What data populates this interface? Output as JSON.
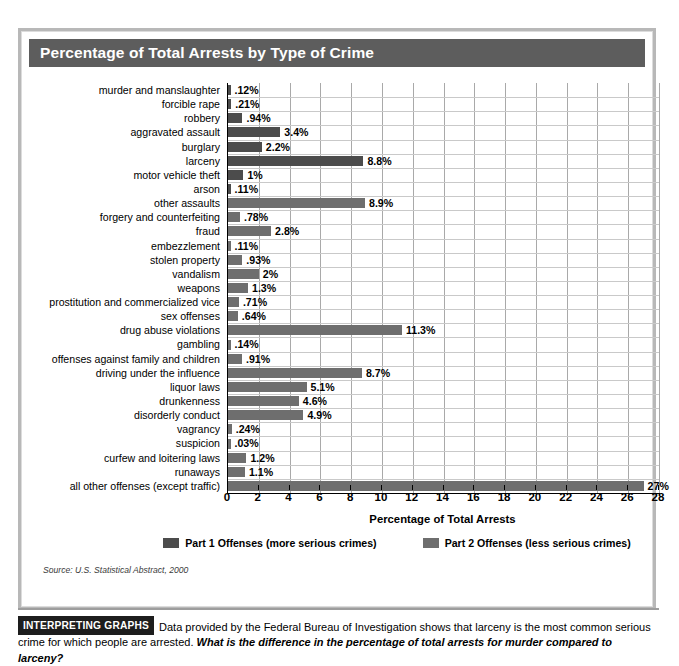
{
  "figure": {
    "title": "Percentage of Total Arrests by Type of Crime",
    "source": "Source: U.S. Statistical Abstract, 2000"
  },
  "chart_data": {
    "type": "bar",
    "orientation": "horizontal",
    "title": "Percentage of Total Arrests by Type of Crime",
    "xlabel": "Percentage of Total Arrests",
    "ylabel": "",
    "xlim": [
      0,
      28
    ],
    "xticks": [
      0,
      2,
      4,
      6,
      8,
      10,
      12,
      14,
      16,
      18,
      20,
      22,
      24,
      26,
      28
    ],
    "grid": "vertical",
    "legend_position": "bottom-center",
    "legend": [
      {
        "name": "Part 1 Offenses (more serious crimes)",
        "color": "#4c4c4c",
        "key": "p1"
      },
      {
        "name": "Part 2 Offenses (less serious crimes)",
        "color": "#6e6e6e",
        "key": "p2"
      }
    ],
    "categories": [
      "murder and manslaughter",
      "forcible rape",
      "robbery",
      "aggravated assault",
      "burglary",
      "larceny",
      "motor vehicle theft",
      "arson",
      "other assaults",
      "forgery and counterfeiting",
      "fraud",
      "embezzlement",
      "stolen property",
      "vandalism",
      "weapons",
      "prostitution and commercialized vice",
      "sex offenses",
      "drug abuse violations",
      "gambling",
      "offenses against family and children",
      "driving under the influence",
      "liquor laws",
      "drunkenness",
      "disorderly conduct",
      "vagrancy",
      "suspicion",
      "curfew and loitering laws",
      "runaways",
      "all other offenses (except traffic)"
    ],
    "values": [
      0.12,
      0.21,
      0.94,
      3.4,
      2.2,
      8.8,
      1,
      0.11,
      8.9,
      0.78,
      2.8,
      0.11,
      0.93,
      2,
      1.3,
      0.71,
      0.64,
      11.3,
      0.14,
      0.91,
      8.7,
      5.1,
      4.6,
      4.9,
      0.24,
      0.03,
      1.2,
      1.1,
      27
    ],
    "value_labels": [
      ".12%",
      ".21%",
      ".94%",
      "3.4%",
      "2.2%",
      "8.8%",
      "1%",
      ".11%",
      "8.9%",
      ".78%",
      "2.8%",
      ".11%",
      ".93%",
      "2%",
      "1.3%",
      ".71%",
      ".64%",
      "11.3%",
      ".14%",
      ".91%",
      "8.7%",
      "5.1%",
      "4.6%",
      "4.9%",
      ".24%",
      ".03%",
      "1.2%",
      "1.1%",
      "27%"
    ],
    "series_keys": [
      "p1",
      "p1",
      "p1",
      "p1",
      "p1",
      "p1",
      "p1",
      "p1",
      "p2",
      "p2",
      "p2",
      "p2",
      "p2",
      "p2",
      "p2",
      "p2",
      "p2",
      "p2",
      "p2",
      "p2",
      "p2",
      "p2",
      "p2",
      "p2",
      "p2",
      "p2",
      "p2",
      "p2",
      "p2"
    ]
  },
  "interpret": {
    "badge": "INTERPRETING GRAPHS",
    "text_plain": "Data provided by the Federal Bureau of Investigation shows that larceny is the most common serious crime for which people are arrested. ",
    "text_question": "What is the difference in the percentage of total arrests for murder compared to larceny?"
  }
}
